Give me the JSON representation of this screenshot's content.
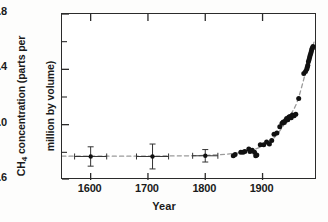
{
  "figure": {
    "ylabel_line1": "CH",
    "ylabel_sub": "4",
    "ylabel_line2": " concentration (parts per",
    "ylabel_line3": "million by volume)",
    "ylabel_full": "CH4 concentration (parts per million by volume)",
    "xlabel": "Year"
  },
  "chart_data": {
    "type": "scatter",
    "title": "",
    "xlabel": "Year",
    "ylabel": "CH4 concentration (parts per million by volume)",
    "xlim": [
      1550,
      1995
    ],
    "ylim": [
      0.6,
      1.8
    ],
    "xticks": [
      1600,
      1700,
      1800,
      1900
    ],
    "xtick_labels": [
      "1600",
      "1700",
      "1800",
      "1900"
    ],
    "yticks": [
      0.6,
      1.0,
      1.4,
      1.8
    ],
    "ytick_labels": [
      "0.6",
      "1.0",
      "1.4",
      "1.8"
    ],
    "yminor_ticks": [
      0.8,
      1.2,
      1.6
    ],
    "grid": false,
    "legend": null,
    "marker_color": "#111111",
    "trend_line_color": "#9a9a9a",
    "trend_line_style": "dashed",
    "series": [
      {
        "name": "Ice-core samples (with error bars)",
        "marker": "filled-circle-with-errorbars",
        "points": [
          {
            "x": 1600,
            "y": 0.77,
            "yerr": 0.07,
            "xerr": 28
          },
          {
            "x": 1708,
            "y": 0.77,
            "yerr": 0.09,
            "xerr": 28
          },
          {
            "x": 1800,
            "y": 0.775,
            "yerr": 0.045,
            "xerr": 22
          }
        ]
      },
      {
        "name": "Ice-core and atmospheric measurements",
        "marker": "filled-circle",
        "points": [
          {
            "x": 1849,
            "y": 0.775
          },
          {
            "x": 1852,
            "y": 0.785
          },
          {
            "x": 1862,
            "y": 0.8
          },
          {
            "x": 1866,
            "y": 0.8
          },
          {
            "x": 1869,
            "y": 0.805
          },
          {
            "x": 1876,
            "y": 0.825
          },
          {
            "x": 1878,
            "y": 0.805
          },
          {
            "x": 1882,
            "y": 0.815
          },
          {
            "x": 1886,
            "y": 0.8
          },
          {
            "x": 1888,
            "y": 0.775
          },
          {
            "x": 1890,
            "y": 0.78
          },
          {
            "x": 1896,
            "y": 0.855
          },
          {
            "x": 1902,
            "y": 0.855
          },
          {
            "x": 1907,
            "y": 0.875
          },
          {
            "x": 1912,
            "y": 0.86
          },
          {
            "x": 1916,
            "y": 0.885
          },
          {
            "x": 1920,
            "y": 0.93
          },
          {
            "x": 1925,
            "y": 0.94
          },
          {
            "x": 1930,
            "y": 0.985
          },
          {
            "x": 1934,
            "y": 1.01
          },
          {
            "x": 1936,
            "y": 1.02
          },
          {
            "x": 1938,
            "y": 1.015
          },
          {
            "x": 1940,
            "y": 1.03
          },
          {
            "x": 1942,
            "y": 1.045
          },
          {
            "x": 1944,
            "y": 1.035
          },
          {
            "x": 1946,
            "y": 1.055
          },
          {
            "x": 1948,
            "y": 1.06
          },
          {
            "x": 1950,
            "y": 1.05
          },
          {
            "x": 1952,
            "y": 1.07
          },
          {
            "x": 1955,
            "y": 1.065
          },
          {
            "x": 1958,
            "y": 1.075
          },
          {
            "x": 1963,
            "y": 1.19
          },
          {
            "x": 1972,
            "y": 1.37
          },
          {
            "x": 1975,
            "y": 1.385
          },
          {
            "x": 1977,
            "y": 1.4
          },
          {
            "x": 1978,
            "y": 1.415
          },
          {
            "x": 1979,
            "y": 1.43
          },
          {
            "x": 1980,
            "y": 1.455
          },
          {
            "x": 1981,
            "y": 1.47
          },
          {
            "x": 1982,
            "y": 1.485
          },
          {
            "x": 1983,
            "y": 1.5
          },
          {
            "x": 1984,
            "y": 1.515
          },
          {
            "x": 1985,
            "y": 1.53
          },
          {
            "x": 1986,
            "y": 1.545
          },
          {
            "x": 1987,
            "y": 1.555
          },
          {
            "x": 1988,
            "y": 1.565
          }
        ]
      }
    ],
    "trend_curve": [
      {
        "x": 1550,
        "y": 0.772
      },
      {
        "x": 1600,
        "y": 0.772
      },
      {
        "x": 1700,
        "y": 0.773
      },
      {
        "x": 1780,
        "y": 0.776
      },
      {
        "x": 1820,
        "y": 0.782
      },
      {
        "x": 1850,
        "y": 0.792
      },
      {
        "x": 1875,
        "y": 0.808
      },
      {
        "x": 1900,
        "y": 0.845
      },
      {
        "x": 1920,
        "y": 0.905
      },
      {
        "x": 1935,
        "y": 0.985
      },
      {
        "x": 1950,
        "y": 1.08
      },
      {
        "x": 1960,
        "y": 1.16
      },
      {
        "x": 1970,
        "y": 1.3
      },
      {
        "x": 1980,
        "y": 1.46
      },
      {
        "x": 1990,
        "y": 1.6
      }
    ]
  }
}
